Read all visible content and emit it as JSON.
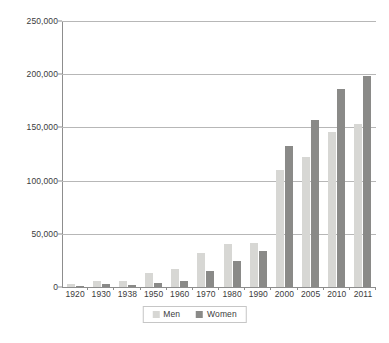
{
  "chart_data": {
    "type": "bar",
    "title": "",
    "xlabel": "",
    "ylabel": "",
    "categories": [
      "1920",
      "1930",
      "1938",
      "1950",
      "1960",
      "1970",
      "1980",
      "1990",
      "2000",
      "2005",
      "2010",
      "2011"
    ],
    "series": [
      {
        "name": "Men",
        "color": "#d7d7d4",
        "values": [
          2500,
          5500,
          5500,
          13000,
          17000,
          32000,
          40000,
          41000,
          110000,
          122000,
          146000,
          153000
        ]
      },
      {
        "name": "Women",
        "color": "#8a8a88",
        "values": [
          900,
          2500,
          2200,
          4000,
          6000,
          15000,
          24000,
          34000,
          133000,
          157000,
          186000,
          198000
        ]
      }
    ],
    "ylim": [
      0,
      250000
    ],
    "yticks": [
      0,
      50000,
      100000,
      150000,
      200000,
      250000
    ],
    "ytick_labels": [
      "0",
      "50,000",
      "100,000",
      "150,000",
      "200,000",
      "250,000"
    ],
    "grid": "horizontal",
    "legend_position": "bottom",
    "legend_entries": [
      "Men",
      "Women"
    ]
  }
}
